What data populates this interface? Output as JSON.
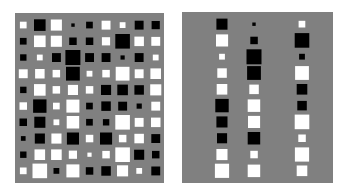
{
  "chart_data": [
    {
      "type": "heatmap",
      "subtype": "hinton",
      "title": "",
      "xlabel": "",
      "ylabel": "",
      "rows": 10,
      "cols": 9,
      "background_color": "#808080",
      "positive_color": "#ffffff",
      "negative_color": "#000000",
      "values": [
        [
          0.2,
          -0.6,
          0.55,
          -0.05,
          -0.2,
          0.35,
          0.15,
          -0.35,
          -0.3
        ],
        [
          -0.2,
          0.6,
          0.55,
          -0.25,
          -0.25,
          0.3,
          -0.95,
          0.4,
          0.35
        ],
        [
          -0.18,
          0.15,
          -0.35,
          -1.0,
          -0.35,
          -0.35,
          -0.08,
          -0.35,
          0.15
        ],
        [
          0.35,
          0.4,
          0.25,
          -0.85,
          0.15,
          0.25,
          0.85,
          0.35,
          0.5
        ],
        [
          -0.18,
          0.6,
          0.25,
          0.45,
          0.25,
          -0.45,
          -0.5,
          -0.4,
          0.55
        ],
        [
          0.25,
          -0.8,
          0.2,
          0.75,
          -0.2,
          -0.4,
          -0.35,
          -0.12,
          0.35
        ],
        [
          -0.25,
          -0.55,
          0.15,
          0.7,
          -0.2,
          -0.18,
          0.95,
          0.35,
          0.4
        ],
        [
          -0.1,
          -0.45,
          0.45,
          -0.65,
          0.25,
          -0.65,
          0.25,
          0.4,
          -0.35
        ],
        [
          -0.18,
          0.5,
          0.5,
          0.3,
          0.08,
          0.25,
          0.95,
          -0.45,
          -0.25
        ],
        [
          0.2,
          0.95,
          -0.15,
          0.75,
          -0.25,
          -0.4,
          0.55,
          0.15,
          -0.35
        ]
      ]
    },
    {
      "type": "heatmap",
      "subtype": "hinton",
      "title": "",
      "xlabel": "",
      "ylabel": "",
      "rows": 10,
      "cols": 3,
      "background_color": "#808080",
      "positive_color": "#ffffff",
      "negative_color": "#000000",
      "values": [
        [
          -0.55,
          -0.05,
          0.2
        ],
        [
          0.65,
          -0.25,
          -0.95
        ],
        [
          0.15,
          -1.0,
          -0.15
        ],
        [
          0.4,
          -0.85,
          0.85
        ],
        [
          0.5,
          0.4,
          -0.5
        ],
        [
          -0.8,
          0.7,
          -0.4
        ],
        [
          -0.55,
          0.65,
          0.95
        ],
        [
          -0.45,
          -0.7,
          0.25
        ],
        [
          0.55,
          0.25,
          0.9
        ],
        [
          0.9,
          0.7,
          0.5
        ]
      ]
    }
  ]
}
